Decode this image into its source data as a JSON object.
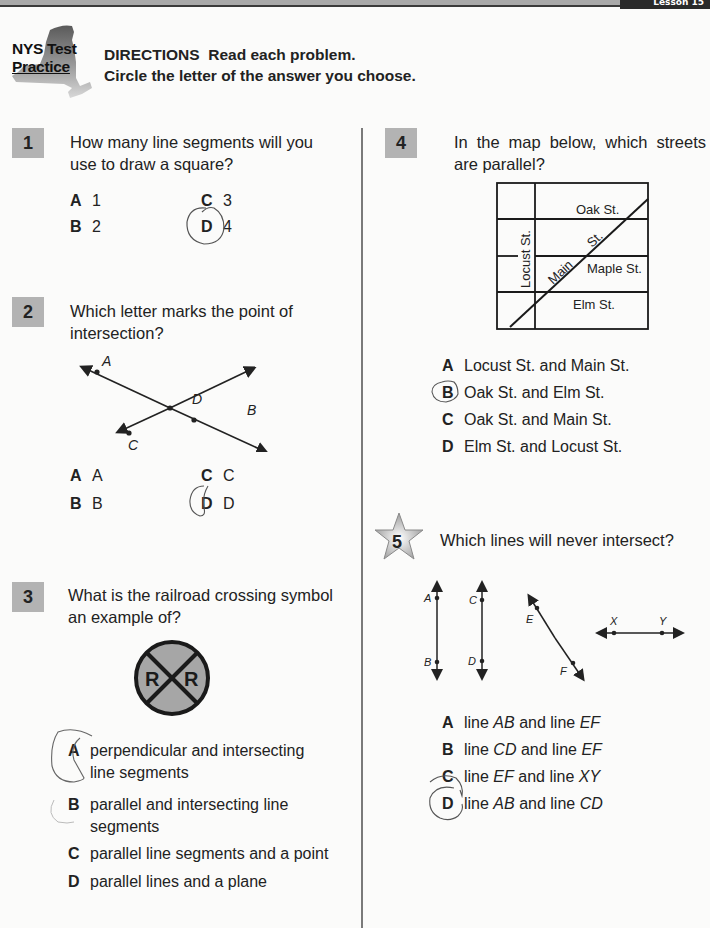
{
  "header": {
    "lesson_tab": "Lesson 15",
    "logo": {
      "line1": "NYS Test",
      "line2": "Practice",
      "shape": "new-york-state-silhouette"
    },
    "directions": {
      "label": "DIRECTIONS",
      "line1_rest": "Read each problem.",
      "line2": "Circle the letter of the answer you choose."
    }
  },
  "colors": {
    "number_box": "#b3b3b3",
    "topbar": "#a9a9a9",
    "ink": "#1e1e1e",
    "pencil": "#555555",
    "sign_fill": "#a6a6a6"
  },
  "questions": [
    {
      "number": "1",
      "text": "How many line segments will you use to draw a square?",
      "text_lines": [
        "How many line segments will you",
        "use to draw a square?"
      ],
      "options": [
        {
          "letter": "A",
          "text": "1"
        },
        {
          "letter": "B",
          "text": "2"
        },
        {
          "letter": "C",
          "text": "3"
        },
        {
          "letter": "D",
          "text": "4"
        }
      ],
      "circled": "D"
    },
    {
      "number": "2",
      "text": "Which letter marks the point of intersection?",
      "text_lines": [
        "Which letter marks the point of",
        "intersection?"
      ],
      "figure": {
        "type": "two-intersecting-lines",
        "points": [
          "A",
          "B",
          "C",
          "D"
        ],
        "intersection": "D"
      },
      "options": [
        {
          "letter": "A",
          "text": "A"
        },
        {
          "letter": "B",
          "text": "B"
        },
        {
          "letter": "C",
          "text": "C"
        },
        {
          "letter": "D",
          "text": "D"
        }
      ],
      "circled": "D"
    },
    {
      "number": "3",
      "text": "What is the railroad crossing symbol an example of?",
      "text_lines": [
        "What is the railroad crossing symbol",
        "an example of?"
      ],
      "figure": {
        "type": "railroad-crossing-sign",
        "left_letter": "R",
        "right_letter": "R"
      },
      "options": [
        {
          "letter": "A",
          "text": "perpendicular and intersecting line segments"
        },
        {
          "letter": "B",
          "text": "parallel and intersecting line segments"
        },
        {
          "letter": "C",
          "text": "parallel line segments and a point"
        },
        {
          "letter": "D",
          "text": "parallel lines and a plane"
        }
      ],
      "circled": "A"
    },
    {
      "number": "4",
      "text": "In the map below, which streets are parallel?",
      "text_lines": [
        "In the map below, which streets",
        "are parallel?"
      ],
      "figure": {
        "type": "street-map",
        "streets": {
          "oak": "Oak St.",
          "maple": "Maple St.",
          "elm": "Elm St.",
          "locust": "Locust St.",
          "main_word": "Main",
          "main_st": "St."
        }
      },
      "options": [
        {
          "letter": "A",
          "text": "Locust St. and Main St."
        },
        {
          "letter": "B",
          "text": "Oak St. and Elm St."
        },
        {
          "letter": "C",
          "text": "Oak St. and Main St."
        },
        {
          "letter": "D",
          "text": "Elm St. and Locust St."
        }
      ],
      "circled": "B"
    },
    {
      "number": "5",
      "badge": "star",
      "text": "Which lines will never intersect?",
      "figure": {
        "type": "four-lines",
        "labels": [
          "A",
          "B",
          "C",
          "D",
          "E",
          "F",
          "X",
          "Y"
        ]
      },
      "options": [
        {
          "letter": "A",
          "pre": "line ",
          "l1": "AB",
          "mid": " and line ",
          "l2": "EF"
        },
        {
          "letter": "B",
          "pre": "line ",
          "l1": "CD",
          "mid": " and line ",
          "l2": "EF"
        },
        {
          "letter": "C",
          "pre": "line ",
          "l1": "EF",
          "mid": " and line ",
          "l2": "XY"
        },
        {
          "letter": "D",
          "pre": "line ",
          "l1": "AB",
          "mid": " and line ",
          "l2": "CD"
        }
      ],
      "circled": "D"
    }
  ]
}
